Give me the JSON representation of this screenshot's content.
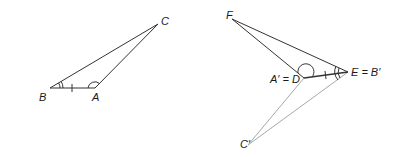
{
  "diagram": {
    "colors": {
      "dark": "#333333",
      "light": "#a8a8a8"
    },
    "triangle_abc": {
      "labels": {
        "A": "A",
        "B": "B",
        "C": "C"
      }
    },
    "triangle_def": {
      "labels": {
        "F": "F",
        "D": "A′ = D",
        "E": "E = B′"
      }
    },
    "image_point": {
      "labels": {
        "C_prime": "C′"
      }
    }
  }
}
